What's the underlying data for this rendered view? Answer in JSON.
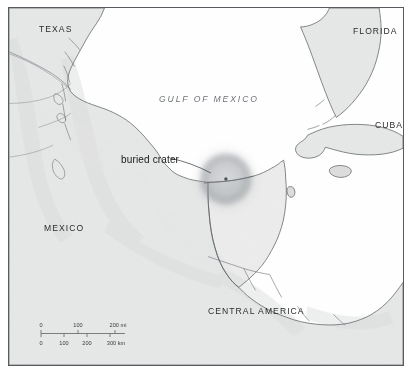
{
  "figure": {
    "type": "reference-map",
    "title_visible": false,
    "background_color": "#ffffff",
    "frame_color": "#575b5f"
  },
  "map": {
    "water_color": "#ffffff",
    "land_color": "#d8d9d8",
    "coast_line_color": "#5e6368",
    "crater": {
      "label": "buried crater",
      "center_marker": "crater-center-dot",
      "halo_color": "#8d9095"
    },
    "labels": {
      "texas": "TEXAS",
      "florida": "FLORIDA",
      "cuba": "CUBA",
      "mexico": "MEXICO",
      "central_america": "CENTRAL AMERICA",
      "gulf_of_mexico": "GULF OF MEXICO"
    }
  },
  "scale_bar": {
    "miles": {
      "ticks": [
        "0",
        "100",
        "200"
      ],
      "unit": "mi",
      "unit_label": "200 mi"
    },
    "kilometers": {
      "ticks": [
        "0",
        "100",
        "200",
        "300"
      ],
      "unit": "km",
      "unit_label": "300 km"
    }
  }
}
